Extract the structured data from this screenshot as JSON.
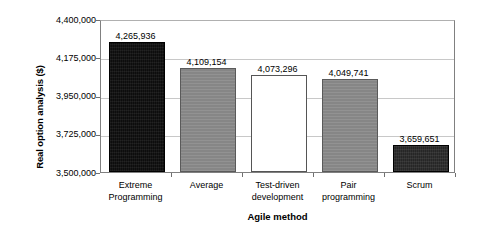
{
  "chart_data": {
    "type": "bar",
    "title": "",
    "subtitle": "",
    "xlabel": "Agile method",
    "ylabel": "Real option analysis ($)",
    "categories": [
      "Extreme\nProgramming",
      "Average",
      "Test-driven\ndevelopment",
      "Pair\nprogramming",
      "Scrum"
    ],
    "values": [
      4265936,
      4109154,
      4073296,
      4049741,
      3659651
    ],
    "value_labels": [
      "4,265,936",
      "4,109,154",
      "4,073,296",
      "4,049,741",
      "3,659,651"
    ],
    "bar_styles": [
      "dark",
      "gray",
      "white",
      "gray",
      "darkish"
    ],
    "bar_colors": [
      "#0d0d0d",
      "#8a8a8a",
      "#ffffff",
      "#8a8a8a",
      "#262626"
    ],
    "ylim": [
      3500000,
      4400000
    ],
    "ytick_values": [
      4400000,
      4175000,
      3950000,
      3725000,
      3500000
    ],
    "ytick_labels": [
      "4,400,000",
      "4,175,000",
      "3,950,000",
      "3,725,000",
      "3,500,000"
    ],
    "grid": true,
    "grid_axis": "y",
    "legend": false,
    "legend_position": "none",
    "background_color": "#ffffff",
    "gridline_color": "#c8c8c8",
    "axis_color": "#808080"
  }
}
